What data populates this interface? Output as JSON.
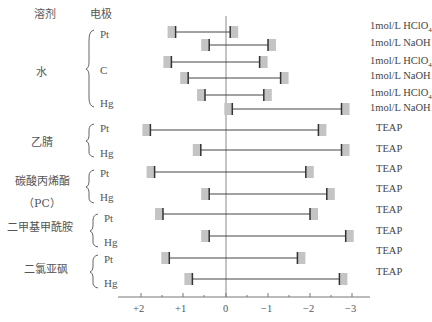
{
  "headers": {
    "solvent": "溶剂",
    "electrode": "电极"
  },
  "solvents": [
    {
      "name": "水",
      "sub": "",
      "electrodes": [
        "Pt",
        "C",
        "Hg"
      ]
    },
    {
      "name": "乙腈",
      "sub": "",
      "electrodes": [
        "Pt",
        "Hg"
      ]
    },
    {
      "name": "碳酸丙烯酯",
      "sub": "（PC）",
      "electrodes": [
        "Pt",
        "Hg"
      ]
    },
    {
      "name": "二甲基甲酰胺",
      "sub": "",
      "electrodes": [
        "Pt",
        "Hg"
      ]
    },
    {
      "name": "二氯亚砜",
      "sub": "",
      "electrodes": [
        "Pt",
        "Hg"
      ]
    }
  ],
  "conditions": [
    "1mol/L HClO4",
    "1mol/L NaOH",
    "1mol/L HClO4",
    "1mol/L NaOH",
    "1mol/L HClO4",
    "1mol/L NaOH",
    "TEAP",
    "TEAP",
    "TEAP",
    "TEAP",
    "TEAP",
    "TEAP",
    "TEAP",
    "TEAP"
  ],
  "chart_data": {
    "type": "bar",
    "orientation": "horizontal-range",
    "title": "",
    "xlabel": "",
    "ylabel": "",
    "x_ticks": [
      "+2",
      "+1",
      "0",
      "−1",
      "−2",
      "−3"
    ],
    "x_tick_values": [
      2,
      1,
      0,
      -1,
      -2,
      -3
    ],
    "xlim": [
      2.9,
      -3.3
    ],
    "grid": false,
    "legend": null,
    "series": [
      {
        "solvent": "水",
        "electrode": "Pt",
        "electrolyte": "1mol/L HClO4",
        "anodic": 1.2,
        "cathodic": -0.1
      },
      {
        "solvent": "水",
        "electrode": "Pt",
        "electrolyte": "1mol/L NaOH",
        "anodic": 0.4,
        "cathodic": -1.0
      },
      {
        "solvent": "水",
        "electrode": "C",
        "electrolyte": "1mol/L HClO4",
        "anodic": 1.3,
        "cathodic": -0.8
      },
      {
        "solvent": "水",
        "electrode": "C",
        "electrolyte": "1mol/L NaOH",
        "anodic": 0.9,
        "cathodic": -1.3
      },
      {
        "solvent": "水",
        "electrode": "Hg",
        "electrolyte": "1mol/L HClO4",
        "anodic": 0.5,
        "cathodic": -0.9
      },
      {
        "solvent": "水",
        "electrode": "Hg",
        "electrolyte": "1mol/L NaOH",
        "anodic": -0.15,
        "cathodic": -2.75
      },
      {
        "solvent": "乙腈",
        "electrode": "Pt",
        "electrolyte": "TEAP",
        "anodic": 1.8,
        "cathodic": -2.2
      },
      {
        "solvent": "乙腈",
        "electrode": "Hg",
        "electrolyte": "TEAP",
        "anodic": 0.6,
        "cathodic": -2.75
      },
      {
        "solvent": "碳酸丙烯酯 (PC)",
        "electrode": "Pt",
        "electrolyte": "TEAP",
        "anodic": 1.7,
        "cathodic": -1.9
      },
      {
        "solvent": "碳酸丙烯酯 (PC)",
        "electrode": "Hg",
        "electrolyte": "TEAP",
        "anodic": 0.4,
        "cathodic": -2.4
      },
      {
        "solvent": "二甲基甲酰胺",
        "electrode": "Pt",
        "electrolyte": "TEAP",
        "anodic": 1.5,
        "cathodic": -2.0
      },
      {
        "solvent": "二甲基甲酰胺",
        "electrode": "Hg",
        "electrolyte": "TEAP",
        "anodic": 0.4,
        "cathodic": -2.85
      },
      {
        "solvent": "二氯亚砜",
        "electrode": "Pt",
        "electrolyte": "TEAP",
        "anodic": 1.35,
        "cathodic": -1.7
      },
      {
        "solvent": "二氯亚砜",
        "electrode": "Hg",
        "electrolyte": "TEAP",
        "anodic": 0.8,
        "cathodic": -2.7
      }
    ]
  }
}
